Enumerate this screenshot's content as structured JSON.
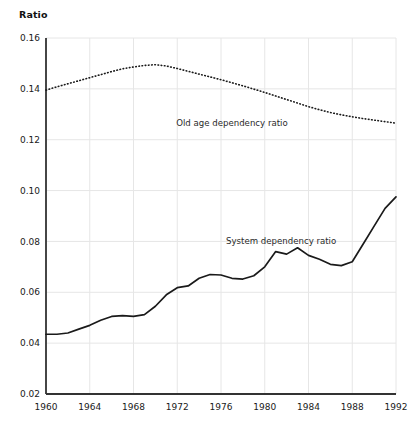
{
  "chart_data": {
    "type": "line",
    "title": "",
    "subtitle": "",
    "xlabel": "",
    "ylabel": "Ratio",
    "ylabel_display": "Ratio",
    "xlim": [
      1960,
      1992
    ],
    "ylim": [
      0.02,
      0.16
    ],
    "grid": true,
    "legend_position": "inline-annotation",
    "y_ticks": [
      0.02,
      0.04,
      0.06,
      0.08,
      0.1,
      0.12,
      0.14,
      0.16
    ],
    "y_tick_labels": [
      "0.02",
      "0.04",
      "0.06",
      "0.08",
      "0.10",
      "0.12",
      "0.14",
      "0.16"
    ],
    "x_ticks": [
      1960,
      1964,
      1968,
      1972,
      1976,
      1980,
      1984,
      1988,
      1992
    ],
    "x_tick_labels": [
      "1960",
      "1964",
      "1968",
      "1972",
      "1976",
      "1980",
      "1984",
      "1988",
      "1992"
    ],
    "x": [
      1960,
      1961,
      1962,
      1963,
      1964,
      1965,
      1966,
      1967,
      1968,
      1969,
      1970,
      1971,
      1972,
      1973,
      1974,
      1975,
      1976,
      1977,
      1978,
      1979,
      1980,
      1981,
      1982,
      1983,
      1984,
      1985,
      1986,
      1987,
      1988,
      1989,
      1990,
      1991,
      1992
    ],
    "series": [
      {
        "name": "Old age dependency ratio",
        "style": "dotted",
        "color": "#1a1a1a",
        "label_x": 1977,
        "label_y": 0.1255,
        "values": [
          0.1395,
          0.1408,
          0.142,
          0.1432,
          0.1444,
          0.1456,
          0.1468,
          0.1479,
          0.1486,
          0.1492,
          0.1495,
          0.149,
          0.148,
          0.1469,
          0.1458,
          0.1447,
          0.1436,
          0.1424,
          0.1412,
          0.1399,
          0.1386,
          0.1372,
          0.1358,
          0.1344,
          0.133,
          0.1318,
          0.1307,
          0.1298,
          0.129,
          0.1283,
          0.1277,
          0.1271,
          0.1265
        ]
      },
      {
        "name": "System dependency ratio",
        "style": "solid",
        "color": "#1a1a1a",
        "label_x": 1981.5,
        "label_y": 0.079,
        "values": [
          0.0435,
          0.0435,
          0.044,
          0.0455,
          0.047,
          0.049,
          0.0505,
          0.0508,
          0.0505,
          0.0512,
          0.0545,
          0.059,
          0.0618,
          0.0625,
          0.0655,
          0.067,
          0.0668,
          0.0655,
          0.0652,
          0.0665,
          0.07,
          0.076,
          0.075,
          0.0775,
          0.0745,
          0.073,
          0.071,
          0.0705,
          0.072,
          0.079,
          0.086,
          0.093,
          0.0975
        ]
      }
    ],
    "series_notes": {
      "old_age_peak_year": 1970,
      "old_age_peak_value": 0.1495,
      "system_peak_year": 1988,
      "system_peak_value": 0.1125
    }
  },
  "labels": {
    "y_axis_title": "Ratio",
    "old_age_label": "Old age dependency ratio",
    "system_label": "System dependency ratio"
  },
  "colors": {
    "background": "#ffffff",
    "axis": "#333333",
    "grid": "#e6e6e6",
    "line": "#1a1a1a",
    "text": "#1a1a1a"
  }
}
